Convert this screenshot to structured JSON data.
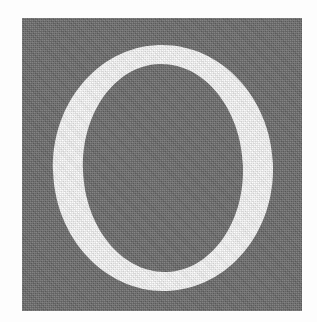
{
  "image": {
    "kind": "scanned-initial-letter",
    "glyph": "O",
    "caption": "",
    "alt_text": "O"
  },
  "canvas": {
    "width": 317,
    "height": 322,
    "background_color": "#fdfdfd"
  },
  "panel": {
    "name": "gray-square-panel",
    "left": 22,
    "top": 18,
    "width": 280,
    "height": 293,
    "fill_color": "#6d6d6d",
    "texture": "halftone-dither"
  },
  "letter": {
    "character": "O",
    "style": "serif-roman-capital",
    "fill_color": "#ffffff",
    "outer": {
      "cx": 163,
      "cy": 168,
      "rx": 110,
      "ry": 123
    },
    "counter": {
      "cx": 163,
      "cy": 168,
      "rx": 80,
      "ry": 104
    },
    "stroke_side_px": 29,
    "stroke_cap_px": 18
  }
}
